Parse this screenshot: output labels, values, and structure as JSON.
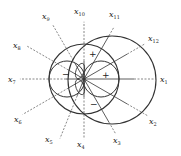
{
  "diagram": {
    "center": [
      84,
      79
    ],
    "axes": [
      {
        "name": "x1",
        "label": "x",
        "sub": "1",
        "angle": 0,
        "solid_to": 155,
        "dash_to": 162,
        "lx": 164,
        "ly": 82
      },
      {
        "name": "x2",
        "label": "x",
        "sub": "2",
        "angle": -30,
        "lx": 153,
        "ly": 124
      },
      {
        "name": "x3",
        "label": "x",
        "sub": "3",
        "angle": -60,
        "lx": 117,
        "ly": 143
      },
      {
        "name": "x4",
        "label": "x",
        "sub": "4",
        "angle": -90,
        "lx": 81,
        "ly": 147
      },
      {
        "name": "x5",
        "label": "x",
        "sub": "5",
        "angle": -112,
        "lx": 49,
        "ly": 142
      },
      {
        "name": "x6",
        "label": "x",
        "sub": "6",
        "angle": -150,
        "lx": 18,
        "ly": 122
      },
      {
        "name": "x7",
        "label": "x",
        "sub": "7",
        "angle": 180,
        "lx": 12,
        "ly": 82
      },
      {
        "name": "x8",
        "label": "x",
        "sub": "8",
        "angle": 150,
        "lx": 17,
        "ly": 48
      },
      {
        "name": "x9",
        "label": "x",
        "sub": "9",
        "angle": 120,
        "lx": 46,
        "ly": 19
      },
      {
        "name": "x10",
        "label": "x",
        "sub": "10",
        "angle": 90,
        "lx": 78,
        "ly": 14
      },
      {
        "name": "x11",
        "label": "x",
        "sub": "11",
        "angle": 60,
        "lx": 113,
        "ly": 17
      },
      {
        "name": "x12",
        "label": "x",
        "sub": "12",
        "angle": 30,
        "lx": 152,
        "ly": 41
      }
    ],
    "signs": [
      {
        "text": "+",
        "x": 89,
        "y": 57
      },
      {
        "text": "+",
        "x": 102,
        "y": 78
      },
      {
        "text": "−",
        "x": 62,
        "y": 77
      },
      {
        "text": "−",
        "x": 90,
        "y": 107
      }
    ]
  }
}
